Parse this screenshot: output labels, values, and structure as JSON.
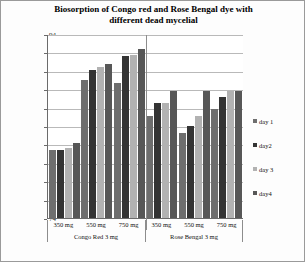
{
  "chart_data": {
    "type": "bar",
    "title": "Biosorption of Congo red and Rose Bengal dye with different dead mycelial",
    "title_line1": "Biosorption of Congo red and Rose Bengal dye with",
    "title_line2": "different dead mycelial",
    "xlabel": "",
    "ylabel": "% of Decolorization",
    "ylim": [
      74,
      94
    ],
    "ytick_step": 2,
    "yticks": [
      94,
      92,
      90,
      88,
      86,
      84,
      82,
      80,
      78,
      76,
      74
    ],
    "grid": true,
    "legend_position": "right",
    "categories": [
      "350 mg",
      "550 mg",
      "750 mg",
      "350 mg",
      "550 mg",
      "750 mg"
    ],
    "panels": [
      {
        "label": "Congo Red 3 mg",
        "categories": [
          "350 mg",
          "550 mg",
          "750 mg"
        ]
      },
      {
        "label": "Rose Bengal 3 mg",
        "categories": [
          "350 mg",
          "550 mg",
          "750 mg"
        ]
      }
    ],
    "series": [
      {
        "name": "day 1",
        "color": "#6e6e6e",
        "values": [
          81.4,
          89.0,
          88.7,
          85.1,
          83.2,
          85.8
        ]
      },
      {
        "name": "day2",
        "color": "#343434",
        "values": [
          81.4,
          90.1,
          91.6,
          86.5,
          84.0,
          87.2
        ]
      },
      {
        "name": "day 3",
        "color": "#b2b2b2",
        "values": [
          81.6,
          90.4,
          91.7,
          86.5,
          85.1,
          87.8
        ]
      },
      {
        "name": "day4",
        "color": "#575757",
        "values": [
          82.2,
          90.7,
          92.4,
          87.8,
          87.8,
          87.8
        ]
      }
    ]
  },
  "legend": {
    "items": [
      {
        "label": "day 1",
        "color": "#6e6e6e"
      },
      {
        "label": "day2",
        "color": "#343434"
      },
      {
        "label": "day 3",
        "color": "#b2b2b2"
      },
      {
        "label": "day4",
        "color": "#575757"
      }
    ]
  }
}
